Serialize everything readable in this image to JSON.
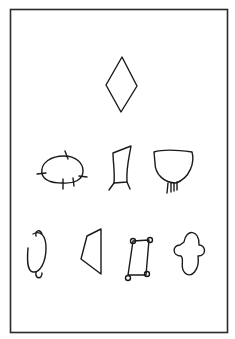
{
  "figure": {
    "frame": {
      "stroke": "#2a2a2a",
      "background": "#ffffff"
    },
    "rows": [
      {
        "row": 1,
        "shapes": [
          "diamond"
        ]
      },
      {
        "row": 2,
        "shapes": [
          "ellipse-with-ticks",
          "trapezoid-with-legs",
          "cup-with-fringe"
        ]
      },
      {
        "row": 3,
        "shapes": [
          "oval-with-knobs",
          "open-trapezoid",
          "rectangle-with-corner-loops",
          "cloud"
        ]
      }
    ]
  }
}
